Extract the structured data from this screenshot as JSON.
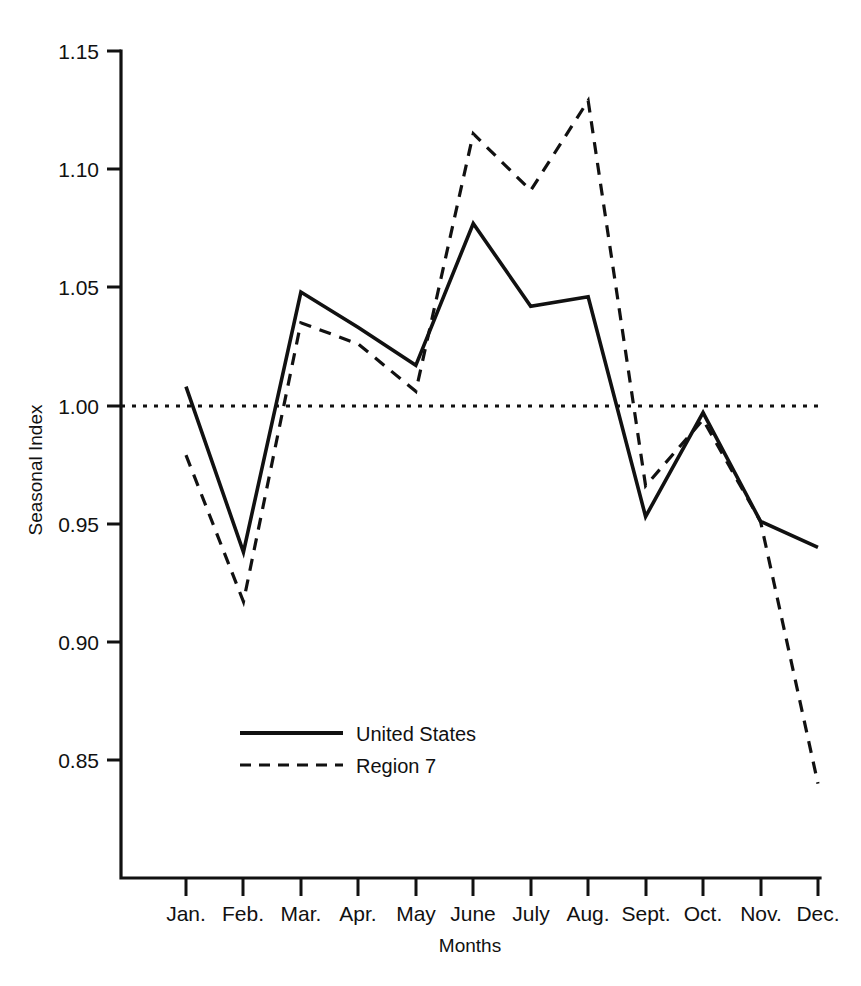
{
  "chart_data": {
    "type": "line",
    "title": "",
    "xlabel": "Months",
    "ylabel": "Seasonal Index",
    "categories": [
      "Jan.",
      "Feb.",
      "Mar.",
      "Apr.",
      "May",
      "June",
      "July",
      "Aug.",
      "Sept.",
      "Oct.",
      "Nov.",
      "Dec."
    ],
    "ylim": [
      0.82,
      1.15
    ],
    "yticks": [
      0.85,
      0.9,
      0.95,
      1.0,
      1.05,
      1.1,
      1.15
    ],
    "ytick_labels": [
      "0.85",
      "0.90",
      "0.95",
      "1.00",
      "1.05",
      "1.10",
      "1.15"
    ],
    "grid": false,
    "reference_line": {
      "value": 1.0,
      "style": "dotted",
      "label": ""
    },
    "legend_position": "inside-lower-left",
    "series": [
      {
        "name": "United States",
        "style": "solid",
        "color": "#111111",
        "values": [
          1.008,
          0.938,
          1.048,
          1.033,
          1.017,
          1.077,
          1.042,
          1.046,
          0.953,
          0.997,
          0.951,
          0.94
        ]
      },
      {
        "name": "Region 7",
        "style": "dashed",
        "color": "#111111",
        "values": [
          0.979,
          0.917,
          1.035,
          1.026,
          1.006,
          1.115,
          1.091,
          1.129,
          0.966,
          0.994,
          0.951,
          0.84
        ]
      }
    ]
  },
  "axes": {
    "y_title": "Seasonal Index",
    "x_title": "Months"
  },
  "legend": {
    "items": [
      {
        "label": "United States",
        "style": "solid"
      },
      {
        "label": "Region 7",
        "style": "dashed"
      }
    ]
  }
}
